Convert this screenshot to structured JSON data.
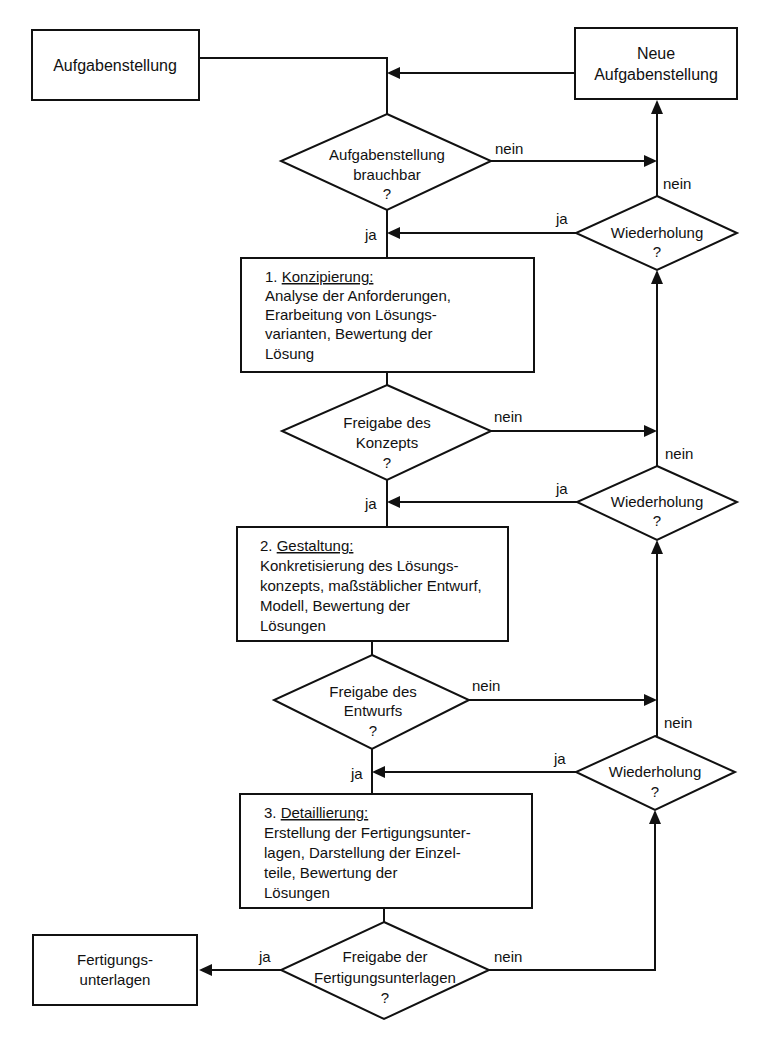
{
  "diagram": {
    "type": "flowchart",
    "language": "de",
    "nodes": {
      "start": {
        "label": "Aufgabenstellung"
      },
      "new_task": {
        "lines": [
          "Neue",
          "Aufgabenstellung"
        ]
      },
      "d_usable": {
        "lines": [
          "Aufgabenstellung",
          "brauchbar",
          "?"
        ]
      },
      "repeat1": {
        "lines": [
          "Wiederholung",
          "?"
        ]
      },
      "phase1": {
        "heading_num": "1. ",
        "heading": "Konzipierung:",
        "lines": [
          "Analyse der Anforderungen,",
          "Erarbeitung von Lösungs-",
          "varianten, Bewertung der",
          "Lösung"
        ]
      },
      "d_concept": {
        "lines": [
          "Freigabe des",
          "Konzepts",
          "?"
        ]
      },
      "repeat2": {
        "lines": [
          "Wiederholung",
          "?"
        ]
      },
      "phase2": {
        "heading_num": "2. ",
        "heading": "Gestaltung:",
        "lines": [
          "Konkretisierung des Lösungs-",
          "konzepts, maßstäblicher Entwurf,",
          "Modell, Bewertung der",
          "Lösungen"
        ]
      },
      "d_design": {
        "lines": [
          "Freigabe des",
          "Entwurfs",
          "?"
        ]
      },
      "repeat3": {
        "lines": [
          "Wiederholung",
          "?"
        ]
      },
      "phase3": {
        "heading_num": "3. ",
        "heading": "Detaillierung:",
        "lines": [
          "Erstellung der Fertigungsunter-",
          "lagen, Darstellung der Einzel-",
          "teile, Bewertung der",
          "Lösungen"
        ]
      },
      "d_docs": {
        "lines": [
          "Freigabe der",
          "Fertigungsunterlagen",
          "?"
        ]
      },
      "end": {
        "lines": [
          "Fertigungs-",
          "unterlagen"
        ]
      }
    },
    "edge_labels": {
      "yes": "ja",
      "no": "nein"
    },
    "edges": [
      {
        "from": "start",
        "to": "d_usable",
        "label": ""
      },
      {
        "from": "new_task",
        "to": "d_usable",
        "label": ""
      },
      {
        "from": "d_usable",
        "to": "phase1",
        "label": "ja"
      },
      {
        "from": "d_usable",
        "to": "new_task",
        "label": "nein"
      },
      {
        "from": "repeat1",
        "to": "new_task",
        "label": "nein"
      },
      {
        "from": "repeat1",
        "to": "phase1",
        "label": "ja"
      },
      {
        "from": "phase1",
        "to": "d_concept",
        "label": ""
      },
      {
        "from": "d_concept",
        "to": "phase2",
        "label": "ja"
      },
      {
        "from": "d_concept",
        "to": "repeat1",
        "label": "nein"
      },
      {
        "from": "repeat2",
        "to": "repeat1",
        "label": "nein"
      },
      {
        "from": "repeat2",
        "to": "phase2",
        "label": "ja"
      },
      {
        "from": "phase2",
        "to": "d_design",
        "label": ""
      },
      {
        "from": "d_design",
        "to": "phase3",
        "label": "ja"
      },
      {
        "from": "d_design",
        "to": "repeat2",
        "label": "nein"
      },
      {
        "from": "repeat3",
        "to": "repeat2",
        "label": "nein"
      },
      {
        "from": "repeat3",
        "to": "phase3",
        "label": "ja"
      },
      {
        "from": "phase3",
        "to": "d_docs",
        "label": ""
      },
      {
        "from": "d_docs",
        "to": "end",
        "label": "ja"
      },
      {
        "from": "d_docs",
        "to": "repeat3",
        "label": "nein"
      }
    ]
  }
}
